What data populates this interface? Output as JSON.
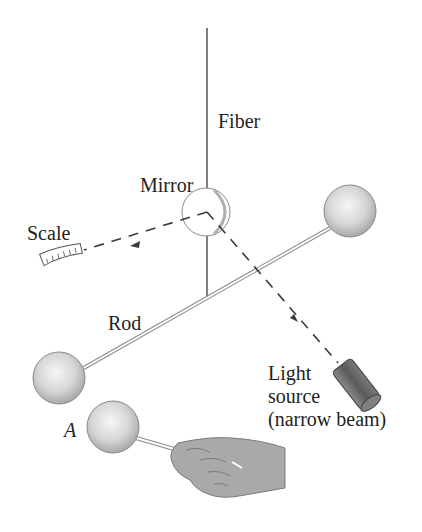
{
  "diagram": {
    "labels": {
      "fiber": "Fiber",
      "mirror": "Mirror",
      "scale": "Scale",
      "rod": "Rod",
      "light_line1": "Light",
      "light_line2": "source",
      "light_line3": "(narrow beam)",
      "sphere_a": "A"
    },
    "colors": {
      "line": "#3a3a3a",
      "sphere_fill": "#d9d9d9",
      "sphere_highlight": "#f4f4f4",
      "hand": "#a9a9a9",
      "cylinder": "#6e6e6e",
      "mirror_shade": "#c9c9c9"
    }
  }
}
